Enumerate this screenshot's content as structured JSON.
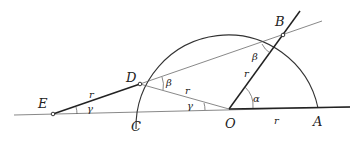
{
  "diagram": {
    "title": "",
    "points": {
      "E": {
        "label": "E",
        "x": 53,
        "y": 114
      },
      "D": {
        "label": "D",
        "x": 140,
        "y": 84
      },
      "C": {
        "label": "C",
        "x": 136,
        "y": 111
      },
      "O": {
        "label": "O",
        "x": 229,
        "y": 109
      },
      "B": {
        "label": "B",
        "x": 283,
        "y": 35
      },
      "A": {
        "label": "A",
        "x": 318,
        "y": 109
      }
    },
    "segment_labels": {
      "ED": "r",
      "DO": "r",
      "OB": "r",
      "OA": "r"
    },
    "angle_labels": {
      "at_E": "γ",
      "at_O_DOC": "γ",
      "at_D": "β",
      "at_B": "β",
      "at_O_BOA": "α"
    },
    "circle": {
      "center": "O",
      "radius": "r"
    }
  }
}
